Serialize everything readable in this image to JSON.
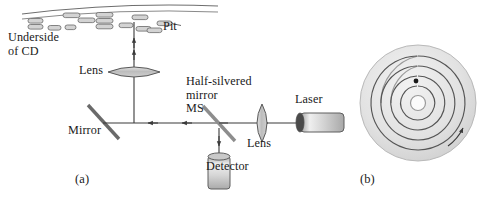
{
  "figure": {
    "panels": [
      {
        "id": "a",
        "label": "(a)",
        "caption": "CD player optical pickup schematic"
      },
      {
        "id": "b",
        "label": "(b)",
        "caption": "Spiral track on a compact disc"
      }
    ]
  },
  "labels": {
    "underside_of_cd": "Underside\nof CD",
    "pit": "Pit",
    "lens_upper": "Lens",
    "half_silvered_mirror": "Half-silvered\nmirror\nMS",
    "mirror": "Mirror",
    "laser": "Laser",
    "lens_lower": "Lens",
    "detector": "Detector",
    "panel_a": "(a)",
    "panel_b": "(b)"
  },
  "components": {
    "cd_surface": {
      "name": "Underside of CD",
      "lines": 2
    },
    "pits": {
      "name": "Pit",
      "count": 14
    },
    "lens_upper": {
      "name": "Lens",
      "orientation": "horizontal",
      "type": "biconvex"
    },
    "lens_lower": {
      "name": "Lens",
      "orientation": "vertical",
      "type": "biconvex"
    },
    "mirror": {
      "name": "Mirror",
      "angle_deg": 45,
      "reflective": "full"
    },
    "half_silvered_mirror": {
      "name": "Half-silvered mirror MS",
      "angle_deg": 45,
      "reflective": "partial"
    },
    "laser": {
      "name": "Laser",
      "shape": "cylinder"
    },
    "detector": {
      "name": "Detector",
      "shape": "cylinder"
    }
  },
  "beam_paths": [
    {
      "name": "laser-to-ms",
      "from": "Laser",
      "to": "MS",
      "direction": "leftward"
    },
    {
      "name": "ms-to-mirror",
      "from": "MS",
      "to": "Mirror",
      "direction": "leftward"
    },
    {
      "name": "mirror-to-cd",
      "from": "Mirror",
      "to": "Underside of CD",
      "direction": "upward"
    },
    {
      "name": "ms-to-detector",
      "from": "MS",
      "to": "Detector",
      "direction": "downward"
    }
  ],
  "cd_track": {
    "type": "spiral",
    "turns": 4,
    "center_hole": true,
    "start_point_marked": true,
    "rotation_arrow": true
  },
  "colors": {
    "ink": "#1a1a1a",
    "line": "#4a4a4a",
    "glass_fill": "#c8c8c8",
    "metal_fill": "#d4d4d4",
    "disc_fill": "#e8e8e8",
    "pit_fill": "#d0d0d0"
  }
}
